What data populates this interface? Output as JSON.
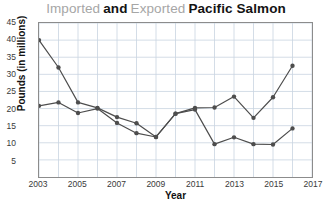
{
  "title": {
    "segments": [
      {
        "text": "Imported",
        "style": "light"
      },
      {
        "text": "and",
        "style": "bold"
      },
      {
        "text": "Exported",
        "style": "light"
      },
      {
        "text": "Pacific Salmon",
        "style": "bold"
      }
    ],
    "plain": "Imported and Exported Pacific Salmon"
  },
  "axes": {
    "x_title": "Year",
    "y_title": "Pounds (in millions)",
    "y_ticks": [
      "45",
      "40",
      "35",
      "30",
      "25",
      "20",
      "15",
      "10",
      "5"
    ],
    "x_ticks": [
      "2003",
      "2005",
      "2007",
      "2009",
      "2011",
      "2013",
      "2015",
      "2017"
    ]
  },
  "colors": {
    "line": "#4d4d4d",
    "marker": "#4d4d4d",
    "grid": "#c9d4e0",
    "frame": "#8c8c8c",
    "title_light": "#a6a6a6",
    "title_bold": "#131313"
  },
  "chart_data": {
    "type": "line",
    "xlabel": "Year",
    "ylabel": "Pounds (in millions)",
    "xlim": [
      2003,
      2017
    ],
    "ylim": [
      0,
      45
    ],
    "y_tick_values": [
      5,
      10,
      15,
      20,
      25,
      30,
      35,
      40,
      45
    ],
    "x_tick_values": [
      2003,
      2005,
      2007,
      2009,
      2011,
      2013,
      2015,
      2017
    ],
    "x_minor_tick_step": 1,
    "grid": true,
    "legend": "none",
    "x": [
      2003,
      2004,
      2005,
      2006,
      2007,
      2008,
      2009,
      2010,
      2011,
      2012,
      2013,
      2014,
      2015,
      2016
    ],
    "series": [
      {
        "name": "Imported",
        "color": "#4d4d4d",
        "marker": "circle",
        "values": [
          40.0,
          32.0,
          21.8,
          20.2,
          17.5,
          15.7,
          11.7,
          18.5,
          20.2,
          20.3,
          23.5,
          17.3,
          23.3,
          32.5
        ]
      },
      {
        "name": "Exported",
        "color": "#4d4d4d",
        "marker": "circle",
        "values": [
          20.8,
          21.8,
          18.7,
          20.0,
          15.8,
          12.8,
          11.7,
          18.5,
          19.7,
          9.6,
          11.6,
          9.6,
          9.5,
          14.2
        ]
      }
    ]
  }
}
